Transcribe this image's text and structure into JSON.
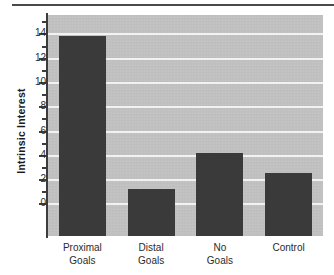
{
  "chart_data": {
    "type": "bar",
    "title": "",
    "subtitle": "",
    "xlabel": "",
    "ylabel": "Intrinsic Interest",
    "categories": [
      "Proximal\nGoals",
      "Distal\nGoals",
      "No\nGoals",
      "Control"
    ],
    "category_labels_flat": [
      "Proximal Goals",
      "Distal Goals",
      "No Goals",
      "Control"
    ],
    "values": [
      13.9,
      1.3,
      4.2,
      2.6
    ],
    "ylim": [
      -2.6,
      15.6
    ],
    "yticks": [
      0,
      2,
      4,
      6,
      8,
      10,
      12,
      14
    ],
    "ytick_labels": [
      "0",
      "2",
      "4",
      "6",
      "8",
      "10",
      "12",
      "14"
    ],
    "yminor_ticks": [
      1,
      3,
      5,
      7,
      9,
      11,
      13,
      15
    ],
    "grid": true,
    "grid_axis": "y",
    "grid_color": "#f2f2f2",
    "legend": false,
    "legend_position": "none",
    "bar_color": "#3a3a3a",
    "plot_background": "#c2c2c2",
    "axis_color": "#3c3c3c",
    "bars_extend_below_zero": true,
    "annotations": []
  },
  "figure": {
    "top_rule_color": "#4a4a4a"
  }
}
